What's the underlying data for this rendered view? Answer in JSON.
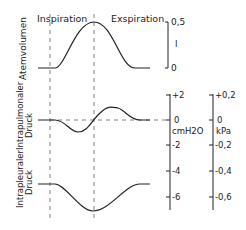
{
  "phases": {
    "inspiration": "Inspiration",
    "expiration": "Exspiration"
  },
  "panels": [
    {
      "label": "Atemvolumen"
    },
    {
      "label_line1": "Intrapulmonaler",
      "label_line2": "Druck"
    },
    {
      "label_line1": "Intrapleuraler",
      "label_line2": "Druck"
    }
  ],
  "volume_axis": {
    "top": "0,5",
    "unit": "l",
    "bottom": "0"
  },
  "pressure_axis_cm": {
    "ticks": [
      "+2",
      "0",
      "-2",
      "-4",
      "-6"
    ],
    "unit": "cmH2O"
  },
  "pressure_axis_kpa": {
    "ticks": [
      "+0,2",
      "0",
      "-0,2",
      "-0,4",
      "-0,6"
    ],
    "unit": "kPa"
  },
  "colors": {
    "line": "#222222",
    "dashed": "#555555"
  }
}
